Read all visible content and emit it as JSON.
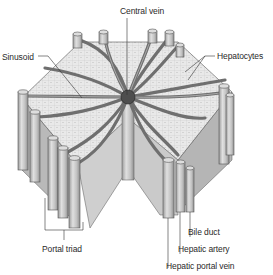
{
  "labels": {
    "central_vein": "Central vein",
    "sinusoid": "Sinusoid",
    "hepatocytes": "Hepatocytes",
    "portal_triad": "Portal triad",
    "bile_duct": "Bile duct",
    "hepatic_artery": "Hepatic artery",
    "hepatic_portal_vein": "Hepatic portal vein"
  },
  "colors": {
    "tube_fill": "#c9c9c9",
    "tube_shade": "#9a9a9a",
    "sinusoid": "#7a7a7a",
    "hepatocyte_face": "#e6e6e6",
    "side_face": "#bdbdbd",
    "central_vein": "#555555",
    "line": "#333333"
  }
}
